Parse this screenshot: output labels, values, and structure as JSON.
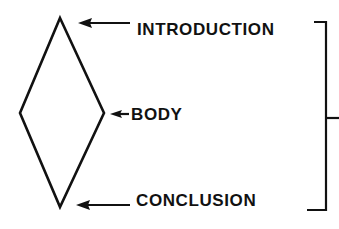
{
  "diagram": {
    "type": "essay-structure",
    "shape": "diamond",
    "stroke_color": "#111111",
    "background": "#ffffff",
    "labels": [
      {
        "id": "introduction",
        "text": "INTRODUCTION",
        "points_to": "diamond-top"
      },
      {
        "id": "body",
        "text": "BODY",
        "points_to": "diamond-middle"
      },
      {
        "id": "conclusion",
        "text": "CONCLUSION",
        "points_to": "diamond-bottom"
      }
    ],
    "bracket": {
      "spans": [
        "introduction",
        "conclusion"
      ],
      "side": "right"
    }
  }
}
